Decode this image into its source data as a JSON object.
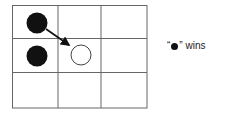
{
  "board": {
    "rows": 3,
    "cols": 3,
    "grid_color": "#666666",
    "cells": [
      {
        "row": 0,
        "col": 0,
        "piece": "black"
      },
      {
        "row": 1,
        "col": 0,
        "piece": "black"
      },
      {
        "row": 1,
        "col": 1,
        "piece": "white"
      }
    ],
    "move": {
      "from": {
        "row": 0,
        "col": 0
      },
      "to": {
        "row": 1,
        "col": 1
      }
    }
  },
  "caption": {
    "open_quote": "“",
    "symbol": "black-dot",
    "close_quote": "”",
    "text": " wins"
  }
}
